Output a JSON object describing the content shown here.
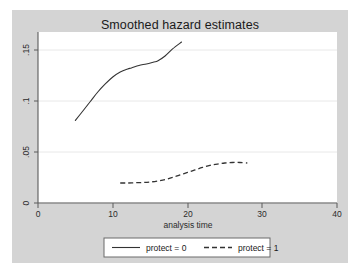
{
  "window": {
    "background_color": "#d4d4d4",
    "page_background_color": "#ffffff",
    "plot_background_color": "#ffffff"
  },
  "chart_data": {
    "type": "line",
    "title": "Smoothed hazard estimates",
    "xlabel": "analysis time",
    "ylabel": "",
    "xlim": [
      0,
      40
    ],
    "ylim": [
      0,
      0.1676
    ],
    "xticks": [
      0,
      10,
      20,
      30,
      40
    ],
    "xtick_labels": [
      "0",
      "10",
      "20",
      "30",
      "40"
    ],
    "yticks": [
      0,
      0.05,
      0.1,
      0.15
    ],
    "ytick_labels": [
      "0",
      ".05",
      ".1",
      ".15"
    ],
    "ytick_label_rotation": -90,
    "grid": "horizontal",
    "grid_color": "#e8e8e8",
    "legend_position": "bottom",
    "series": [
      {
        "name": "protect = 0",
        "style": "solid",
        "color": "#333333",
        "x": [
          5.0,
          6.0,
          7.0,
          8.0,
          9.0,
          10.0,
          11.0,
          12.0,
          12.5,
          13.5,
          14.5,
          15.5,
          16.0,
          17.0,
          18.0,
          19.2
        ],
        "y": [
          0.0809,
          0.0902,
          0.0995,
          0.1088,
          0.1167,
          0.1235,
          0.1284,
          0.1314,
          0.1324,
          0.1348,
          0.1363,
          0.1382,
          0.1392,
          0.1441,
          0.151,
          0.1578
        ]
      },
      {
        "name": "protect = 1",
        "style": "dashed",
        "color": "#333333",
        "x": [
          11.0,
          12.0,
          13.0,
          14.0,
          15.0,
          16.0,
          17.0,
          18.0,
          19.0,
          20.0,
          21.0,
          22.0,
          23.0,
          24.0,
          25.0,
          26.0,
          27.0,
          28.0
        ],
        "y": [
          0.0196,
          0.0196,
          0.0199,
          0.0201,
          0.0206,
          0.0216,
          0.023,
          0.025,
          0.0275,
          0.0299,
          0.0324,
          0.0348,
          0.0368,
          0.0382,
          0.0392,
          0.0397,
          0.0397,
          0.0392
        ]
      }
    ]
  },
  "legend": {
    "items": [
      {
        "label": "protect = 0",
        "style": "solid"
      },
      {
        "label": "protect = 1",
        "style": "dashed"
      }
    ]
  }
}
